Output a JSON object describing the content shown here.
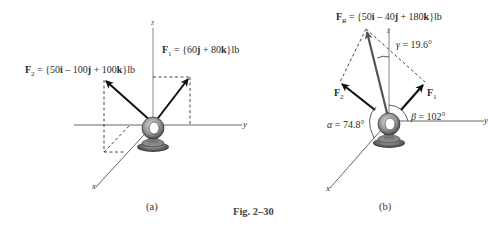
{
  "figure": {
    "caption": "Fig. 2–30",
    "panels": [
      {
        "id": "a",
        "label": "(a)",
        "axes": {
          "x": "x",
          "y": "y",
          "z": "z"
        },
        "forces": [
          {
            "name": "F",
            "sub": "1",
            "expr": " = {60",
            "parts": [
              "j",
              " + 80",
              "k",
              "}lb"
            ]
          },
          {
            "name": "F",
            "sub": "2",
            "expr": " = {50",
            "parts": [
              "i",
              " – 100",
              "j",
              " + 100",
              "k",
              "}lb"
            ]
          }
        ]
      },
      {
        "id": "b",
        "label": "(b)",
        "axes": {
          "x": "x",
          "y": "y",
          "z": "z"
        },
        "resultant": {
          "name": "F",
          "sub": "R",
          "expr": " = {50",
          "parts": [
            "i",
            " – 40",
            "j",
            " + 180",
            "k",
            "}lb"
          ]
        },
        "force_labels": {
          "f1": "F",
          "f1_sub": "1",
          "f2": "F",
          "f2_sub": "2"
        },
        "angles": {
          "alpha": {
            "symbol": "α",
            "text": " = 74.8°"
          },
          "beta": {
            "symbol": "β",
            "text": " = 102°"
          },
          "gamma": {
            "symbol": "γ",
            "text": " = 19.6°"
          }
        }
      }
    ]
  }
}
